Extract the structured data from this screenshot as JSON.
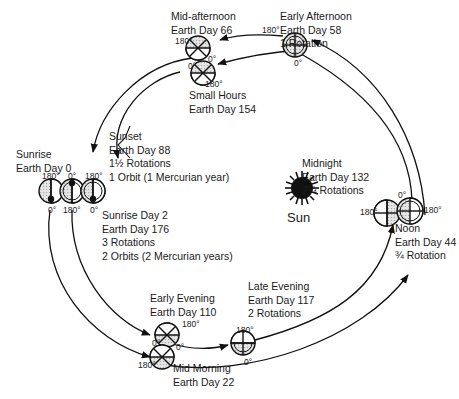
{
  "sun": {
    "label": "Sun"
  },
  "degree_labels": {
    "zero": "0°",
    "one_eighty": "180°"
  },
  "positions": [
    {
      "id": "sunrise",
      "lines": [
        "Sunrise",
        "Earth Day 0"
      ]
    },
    {
      "id": "mid-morning",
      "lines": [
        "Mid Morning",
        "Earth Day 22"
      ]
    },
    {
      "id": "noon",
      "lines": [
        "Noon",
        "Earth Day 44",
        "¾ Rotation"
      ]
    },
    {
      "id": "early-afternoon",
      "lines": [
        "Early Afternoon",
        "Earth Day 58",
        "1 Rotation"
      ]
    },
    {
      "id": "mid-afternoon",
      "lines": [
        "Mid-afternoon",
        "Earth Day 66"
      ]
    },
    {
      "id": "sunset",
      "lines": [
        "Sunset",
        "Earth Day 88",
        "1½ Rotations",
        "1 Orbit (1 Mercurian year)"
      ]
    },
    {
      "id": "early-evening",
      "lines": [
        "Early Evening",
        "Earth Day 110"
      ]
    },
    {
      "id": "late-evening",
      "lines": [
        "Late Evening",
        "Earth Day 117",
        "2 Rotations"
      ]
    },
    {
      "id": "midnight",
      "lines": [
        "Midnight",
        "Earth Day 132",
        "2¼ Rotations"
      ]
    },
    {
      "id": "small-hours",
      "lines": [
        "Small Hours",
        "Earth Day 154"
      ]
    },
    {
      "id": "sunrise-day-2",
      "lines": [
        "Sunrise Day 2",
        "Earth Day 176",
        "3 Rotations",
        "2 Orbits (2 Mercurian years)"
      ]
    }
  ]
}
